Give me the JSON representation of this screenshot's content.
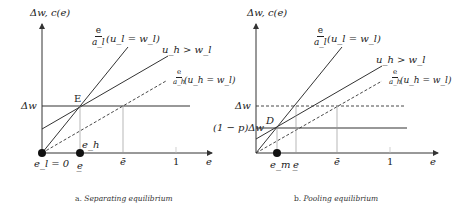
{
  "panels": [
    {
      "id": "separating",
      "caption_prefix": "a.",
      "caption_title": "Separating equilibrium",
      "y_axis_label": "Δw, c(e)",
      "x_axis_label": "e",
      "level_label": "Δw",
      "point_label": "E",
      "curves": {
        "low_cost_fraction_num": "e",
        "low_cost_fraction_den": "a_l",
        "low_cost_condition": "(u_l = w_l)",
        "indiff_label": "u_h > w_l",
        "high_cost_fraction_num": "e",
        "high_cost_fraction_den": "a_h",
        "high_cost_condition": "(u_h = w_l)"
      },
      "x_ticks": {
        "origin": "e_l = 0",
        "e_lower": "e̲",
        "e_bar": "ē",
        "one": "1"
      },
      "dot_labels": {
        "e_h": "e_h"
      }
    },
    {
      "id": "pooling",
      "caption_prefix": "b.",
      "caption_title": "Pooling equilibrium",
      "y_axis_label": "Δw, c(e)",
      "x_axis_label": "e",
      "level_label": "Δw",
      "level2_label": "(1 − p)Δw",
      "point_label": "D",
      "curves": {
        "low_cost_fraction_num": "e",
        "low_cost_fraction_den": "a_l",
        "low_cost_condition": "(u_l = w_l)",
        "indiff_label": "u_h > w_l",
        "high_cost_fraction_num": "e",
        "high_cost_fraction_den": "a_h",
        "high_cost_condition": "(u_h = w_l)"
      },
      "x_ticks": {
        "e_m": "e_m",
        "e_lower": "e̲",
        "e_bar": "ē",
        "one": "1"
      }
    }
  ],
  "colors": {
    "line": "#333333",
    "thin": "#888888",
    "dot": "#111111"
  }
}
